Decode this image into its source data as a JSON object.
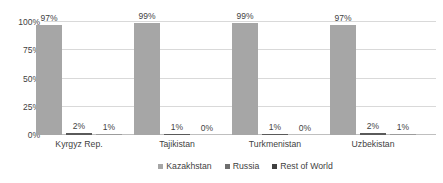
{
  "chart_data": {
    "type": "bar",
    "title": "",
    "xlabel": "",
    "ylabel": "",
    "categories": [
      "Kyrgyz Rep.",
      "Tajikistan",
      "Turkmenistan",
      "Uzbekistan"
    ],
    "series": [
      {
        "name": "Kazakhstan",
        "color": "#a6a6a6",
        "values": [
          97,
          99,
          99,
          97
        ],
        "labels": [
          "97%",
          "99%",
          "99%",
          "97%"
        ]
      },
      {
        "name": "Russia",
        "color": "#5a5a5a",
        "values": [
          2,
          1,
          1,
          2
        ],
        "labels": [
          "2%",
          "1%",
          "1%",
          "2%"
        ]
      },
      {
        "name": "Rest of World",
        "color": "#9c9c9c",
        "values": [
          1,
          0,
          0,
          1
        ],
        "labels": [
          "1%",
          "0%",
          "0%",
          "1%"
        ]
      }
    ],
    "ylim": [
      0,
      100
    ],
    "yticks": [
      0,
      25,
      50,
      75,
      100
    ],
    "ytick_labels": [
      "0%",
      "25%",
      "50%",
      "75%",
      "100%"
    ],
    "grid": true,
    "legend_position": "bottom",
    "legend": [
      "Kazakhstan",
      "Russia",
      "Rest of World"
    ]
  }
}
